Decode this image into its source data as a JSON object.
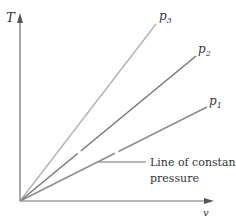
{
  "diagram": {
    "title": "",
    "y_axis": {
      "label": "T"
    },
    "x_axis": {
      "label": "v"
    },
    "lines": [
      {
        "id": "p3",
        "label_main": "p",
        "label_sub": "3",
        "color": "#b5b5b5",
        "end": [
          156,
          24
        ]
      },
      {
        "id": "p2",
        "label_main": "p",
        "label_sub": "2",
        "color": "#7a7a7a",
        "end": [
          196,
          56
        ]
      },
      {
        "id": "p1",
        "label_main": "p",
        "label_sub": "1",
        "color": "#8c8c8c",
        "end": [
          207,
          107
        ]
      }
    ],
    "annotation": {
      "line1": "Line of constant",
      "line2": "pressure"
    },
    "colors": {
      "axis": "#707070",
      "text": "#333333"
    }
  }
}
